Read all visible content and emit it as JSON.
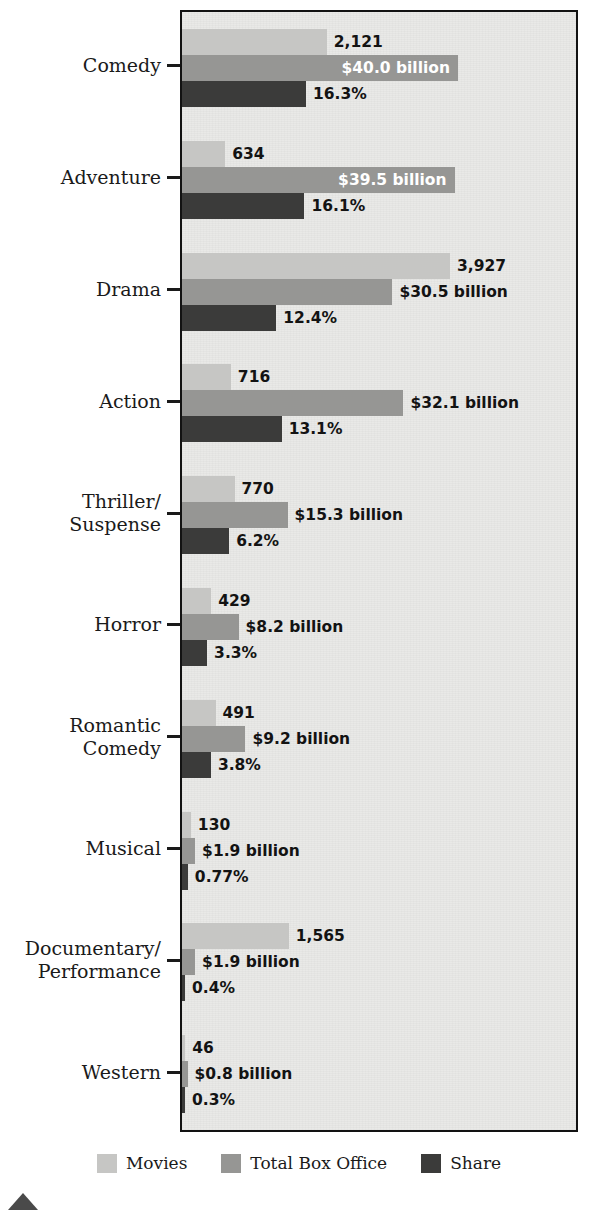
{
  "chart_data": {
    "type": "bar",
    "orientation": "horizontal",
    "title": "",
    "subtitle": "",
    "xlabel": "",
    "ylabel": "",
    "grid": false,
    "legend_position": "bottom",
    "categories": [
      "Comedy",
      "Adventure",
      "Drama",
      "Action",
      "Thriller/\nSuspense",
      "Horror",
      "Romantic\nComedy",
      "Musical",
      "Documentary/\nPerformance",
      "Western"
    ],
    "series": [
      {
        "name": "Movies",
        "color": "#c6c6c4",
        "values": [
          2121,
          634,
          3927,
          716,
          770,
          429,
          491,
          130,
          1565,
          46
        ],
        "labels": [
          "2,121",
          "634",
          "3,927",
          "716",
          "770",
          "429",
          "491",
          "130",
          "1,565",
          "46"
        ],
        "max": 3927
      },
      {
        "name": "Total Box Office",
        "color": "#969694",
        "values": [
          40.0,
          39.5,
          30.5,
          32.1,
          15.3,
          8.2,
          9.2,
          1.9,
          1.9,
          0.8
        ],
        "labels": [
          "$40.0 billion",
          "$39.5 billion",
          "$30.5 billion",
          "$32.1 billion",
          "$15.3 billion",
          "$8.2 billion",
          "$9.2 billion",
          "$1.9 billion",
          "$1.9 billion",
          "$0.8 billion"
        ],
        "label_inside": [
          true,
          true,
          false,
          false,
          false,
          false,
          false,
          false,
          false,
          false
        ],
        "max": 40.0,
        "unit": "billion USD"
      },
      {
        "name": "Share",
        "color": "#3b3b3a",
        "values": [
          16.3,
          16.1,
          12.4,
          13.1,
          6.2,
          3.3,
          3.8,
          0.77,
          0.4,
          0.3
        ],
        "labels": [
          "16.3%",
          "16.1%",
          "12.4%",
          "13.1%",
          "6.2%",
          "3.3%",
          "3.8%",
          "0.77%",
          "0.4%",
          "0.3%"
        ],
        "max": 16.3,
        "unit": "percent"
      }
    ]
  },
  "legend": {
    "items": [
      {
        "label": "Movies",
        "color": "#c6c6c4"
      },
      {
        "label": "Total Box Office",
        "color": "#969694"
      },
      {
        "label": "Share",
        "color": "#3b3b3a"
      }
    ]
  },
  "colors": {
    "movies": "#c6c6c4",
    "box_office": "#969694",
    "share": "#3b3b3a",
    "plot_background": "#e9e9e7",
    "plot_border": "#121212",
    "text": "#131313"
  }
}
